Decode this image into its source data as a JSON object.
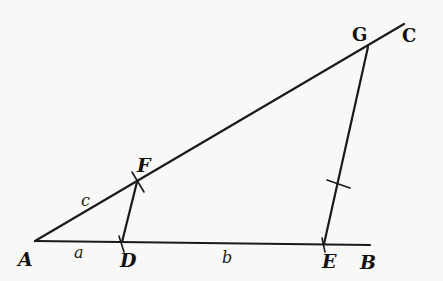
{
  "figure": {
    "type": "geometric-construction",
    "points": {
      "A": {
        "label": "A",
        "x": 35,
        "y": 241
      },
      "B": {
        "label": "B",
        "x": 370,
        "y": 245
      },
      "C": {
        "label": "C",
        "x": 404,
        "y": 24
      },
      "D": {
        "label": "D",
        "x": 122,
        "y": 242
      },
      "E": {
        "label": "E",
        "x": 324,
        "y": 244
      },
      "F": {
        "label": "F",
        "x": 137,
        "y": 182
      },
      "G": {
        "label": "G",
        "x": 368,
        "y": 47
      }
    },
    "segment_labels": {
      "a": "a",
      "b": "b",
      "c": "c"
    },
    "lines": [
      {
        "from": "A",
        "to": "C"
      },
      {
        "from": "A",
        "to": "B"
      },
      {
        "from": "F",
        "to": "D"
      },
      {
        "from": "G",
        "to": "E"
      }
    ]
  }
}
